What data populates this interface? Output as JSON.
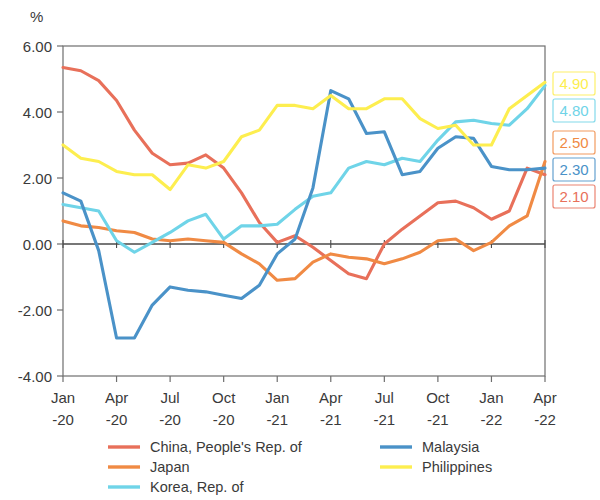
{
  "chart_data": {
    "type": "line",
    "title": "",
    "subtitle": "",
    "xlabel": "",
    "ylabel": "%",
    "unit_label": "%",
    "ylim": [
      -4.0,
      6.0
    ],
    "yticks": [
      6.0,
      4.0,
      2.0,
      0.0,
      -2.0,
      -4.0
    ],
    "ytick_labels": [
      "6.00",
      "4.00",
      "2.00",
      "0.00",
      "-2.00",
      "-4.00"
    ],
    "categories": [
      "Jan-20",
      "Feb-20",
      "Mar-20",
      "Apr-20",
      "May-20",
      "Jun-20",
      "Jul-20",
      "Aug-20",
      "Sep-20",
      "Oct-20",
      "Nov-20",
      "Dec-20",
      "Jan-21",
      "Feb-21",
      "Mar-21",
      "Apr-21",
      "May-21",
      "Jun-21",
      "Jul-21",
      "Aug-21",
      "Sep-21",
      "Oct-21",
      "Nov-21",
      "Dec-21",
      "Jan-22",
      "Feb-22",
      "Mar-22",
      "Apr-22"
    ],
    "xtick_labels": [
      {
        "month": "Jan",
        "year": "-20"
      },
      {
        "month": "Apr",
        "year": "-20"
      },
      {
        "month": "Jul",
        "year": "-20"
      },
      {
        "month": "Oct",
        "year": "-20"
      },
      {
        "month": "Jan",
        "year": "-21"
      },
      {
        "month": "Apr",
        "year": "-21"
      },
      {
        "month": "Jul",
        "year": "-21"
      },
      {
        "month": "Oct",
        "year": "-21"
      },
      {
        "month": "Jan",
        "year": "-22"
      },
      {
        "month": "Apr",
        "year": "-22"
      }
    ],
    "grid": false,
    "legend_position": "bottom",
    "zero_line": true,
    "series": [
      {
        "name": "China, People's Rep. of",
        "color": "#e8705a",
        "end_label": "2.10",
        "values": [
          5.35,
          5.25,
          4.95,
          4.35,
          3.45,
          2.75,
          2.4,
          2.45,
          2.7,
          2.3,
          1.55,
          0.65,
          0.05,
          0.25,
          -0.1,
          -0.5,
          -0.9,
          -1.05,
          0.0,
          0.45,
          0.85,
          1.25,
          1.3,
          1.1,
          0.75,
          1.0,
          2.3,
          2.1
        ]
      },
      {
        "name": "Japan",
        "color": "#f08a44",
        "end_label": "2.50",
        "values": [
          0.7,
          0.55,
          0.5,
          0.4,
          0.35,
          0.15,
          0.1,
          0.15,
          0.1,
          0.05,
          -0.3,
          -0.6,
          -1.1,
          -1.05,
          -0.55,
          -0.3,
          -0.4,
          -0.45,
          -0.6,
          -0.45,
          -0.25,
          0.1,
          0.15,
          -0.2,
          0.05,
          0.55,
          0.85,
          2.5
        ]
      },
      {
        "name": "Korea, Rep. of",
        "color": "#6fd4e8",
        "end_label": "4.80",
        "values": [
          1.2,
          1.1,
          1.0,
          0.1,
          -0.25,
          0.05,
          0.35,
          0.7,
          0.9,
          0.15,
          0.55,
          0.55,
          0.6,
          1.05,
          1.45,
          1.55,
          2.3,
          2.5,
          2.4,
          2.6,
          2.5,
          3.15,
          3.7,
          3.75,
          3.65,
          3.6,
          4.1,
          4.8
        ]
      },
      {
        "name": "Malaysia",
        "color": "#4a92c8",
        "end_label": "2.30",
        "values": [
          1.55,
          1.3,
          -0.2,
          -2.85,
          -2.85,
          -1.85,
          -1.3,
          -1.4,
          -1.45,
          -1.55,
          -1.65,
          -1.25,
          -0.3,
          0.15,
          1.7,
          4.65,
          4.4,
          3.35,
          3.4,
          2.1,
          2.2,
          2.9,
          3.25,
          3.2,
          2.35,
          2.25,
          2.25,
          2.3
        ]
      },
      {
        "name": "Philippines",
        "color": "#fdee4f",
        "end_label": "4.90",
        "values": [
          3.0,
          2.6,
          2.5,
          2.2,
          2.1,
          2.1,
          1.65,
          2.4,
          2.3,
          2.5,
          3.25,
          3.45,
          4.2,
          4.2,
          4.1,
          4.5,
          4.1,
          4.1,
          4.4,
          4.4,
          3.8,
          3.5,
          3.6,
          3.0,
          3.0,
          4.1,
          4.5,
          4.9
        ]
      }
    ],
    "end_labels": [
      {
        "value": "4.90",
        "series": "Philippines",
        "color": "#fdee4f"
      },
      {
        "value": "4.80",
        "series": "Korea, Rep. of",
        "color": "#6fd4e8"
      },
      {
        "value": "2.50",
        "series": "Japan",
        "color": "#f08a44"
      },
      {
        "value": "2.30",
        "series": "Malaysia",
        "color": "#4a92c8"
      },
      {
        "value": "2.10",
        "series": "China, People's Rep. of",
        "color": "#e8705a"
      }
    ],
    "legend": [
      {
        "label": "China, People's Rep. of",
        "color": "#e8705a",
        "column": 0
      },
      {
        "label": "Japan",
        "color": "#f08a44",
        "column": 0
      },
      {
        "label": "Korea, Rep. of",
        "color": "#6fd4e8",
        "column": 0
      },
      {
        "label": "Malaysia",
        "color": "#4a92c8",
        "column": 1
      },
      {
        "label": "Philippines",
        "color": "#fdee4f",
        "column": 1
      }
    ]
  }
}
